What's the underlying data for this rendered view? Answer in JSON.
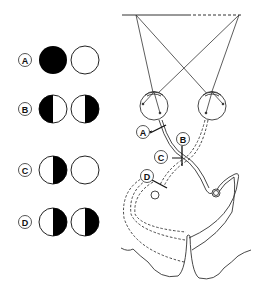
{
  "diagram": {
    "colors": {
      "ink": "#111111",
      "paper": "#ffffff",
      "line": "#333333"
    },
    "legend": [
      {
        "label": "A",
        "left_eye": "full-black",
        "right_eye": "white"
      },
      {
        "label": "B",
        "left_eye": "left-half-black",
        "right_eye": "right-half-black"
      },
      {
        "label": "C",
        "left_eye": "right-half-black",
        "right_eye": "white"
      },
      {
        "label": "D",
        "left_eye": "right-half-black",
        "right_eye": "right-half-black"
      }
    ],
    "lesion_labels": [
      "A",
      "B",
      "C",
      "D"
    ]
  }
}
